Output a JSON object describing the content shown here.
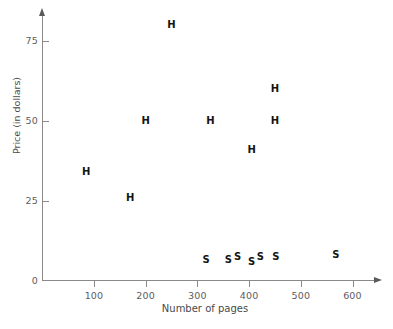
{
  "chart_data": {
    "type": "scatter",
    "title": "",
    "xlabel": "Number of pages",
    "ylabel": "Price (in dollars)",
    "xlim": [
      0,
      640
    ],
    "ylim": [
      0,
      82
    ],
    "xticks": [
      100,
      200,
      300,
      400,
      500,
      600
    ],
    "xtick_labels": [
      "100",
      "200",
      "300",
      "400",
      "500",
      "600"
    ],
    "yticks": [
      0,
      25,
      50,
      75
    ],
    "ytick_labels": [
      "0",
      "25",
      "50",
      "75"
    ],
    "grid": false,
    "legend": "none",
    "marker_style": "text-letter",
    "series": [
      {
        "name": "H",
        "marker_label": "H",
        "points": [
          {
            "x": 85,
            "y": 34
          },
          {
            "x": 170,
            "y": 26
          },
          {
            "x": 200,
            "y": 50
          },
          {
            "x": 250,
            "y": 80
          },
          {
            "x": 325,
            "y": 50
          },
          {
            "x": 405,
            "y": 41
          },
          {
            "x": 450,
            "y": 60
          },
          {
            "x": 450,
            "y": 50
          }
        ]
      },
      {
        "name": "S",
        "marker_label": "S",
        "points": [
          {
            "x": 317,
            "y": 6.5
          },
          {
            "x": 360,
            "y": 6.5
          },
          {
            "x": 378,
            "y": 7.5
          },
          {
            "x": 405,
            "y": 6
          },
          {
            "x": 422,
            "y": 7.5
          },
          {
            "x": 452,
            "y": 7.5
          },
          {
            "x": 568,
            "y": 8
          }
        ]
      }
    ]
  },
  "axes": {
    "x_title": "Number of pages",
    "y_title": "Price (in dollars)"
  }
}
